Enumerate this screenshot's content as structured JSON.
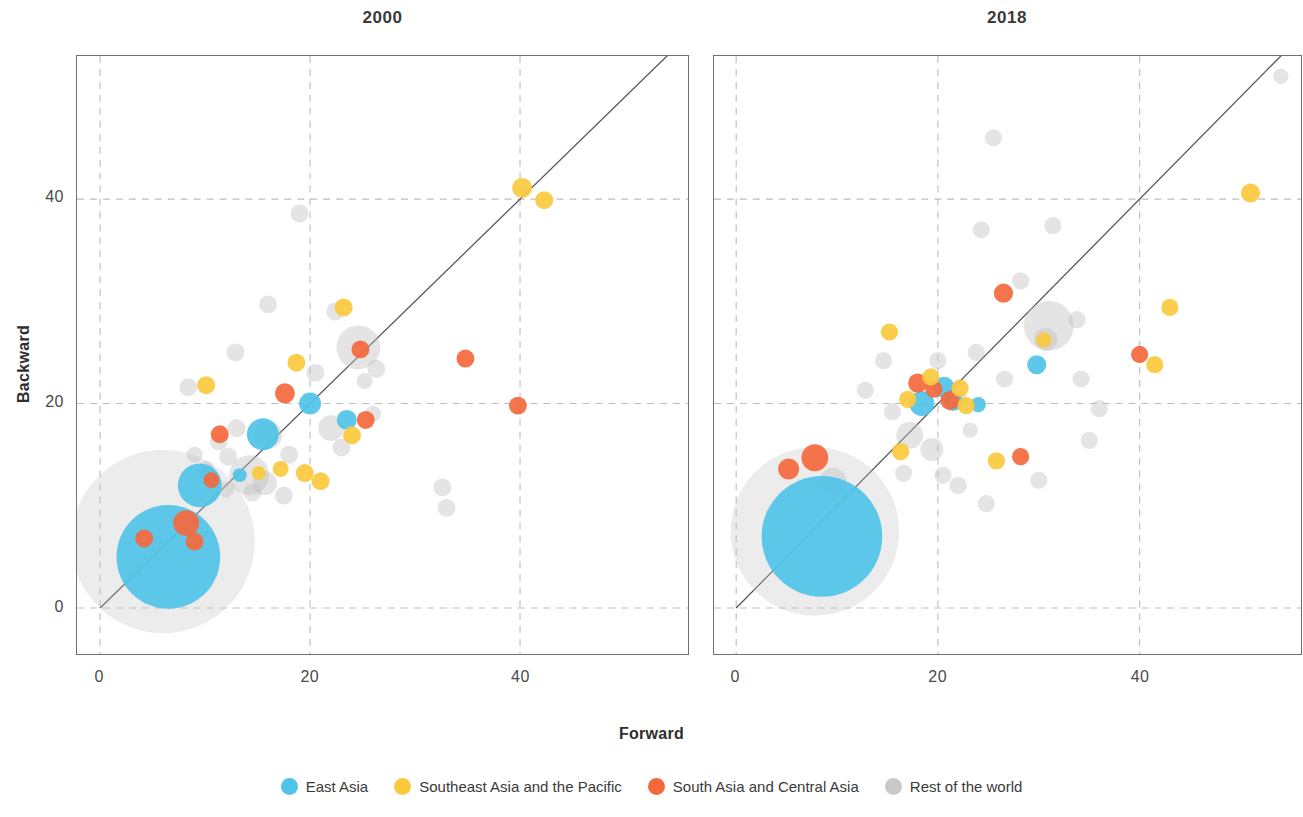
{
  "figure": {
    "xlabel": "Forward",
    "ylabel": "Backward"
  },
  "panels": [
    {
      "id": "2000",
      "title": "2000"
    },
    {
      "id": "2018",
      "title": "2018"
    }
  ],
  "axes": {
    "xticks": [
      "0",
      "20",
      "40"
    ],
    "yticks": [
      "0",
      "20",
      "40"
    ],
    "xtick_values": [
      0,
      20,
      40
    ],
    "ytick_values": [
      0,
      20,
      40
    ]
  },
  "legend": {
    "items": [
      {
        "label": "East Asia",
        "color": "#4FC3E8"
      },
      {
        "label": "Southeast Asia and the Pacific",
        "color": "#FBC93D"
      },
      {
        "label": "South Asia and Central Asia",
        "color": "#F4683C"
      },
      {
        "label": "Rest of the world",
        "color": "#BFBFBF"
      }
    ]
  },
  "colors": {
    "east_asia": "#4FC3E8",
    "southeast_asia": "#FBC93D",
    "south_central_asia": "#F4683C",
    "rest_of_world": "#BFBFBF",
    "gridline": "#BDBDBD",
    "frame": "#6F6F6F",
    "diagonal": "#55555a",
    "text": "#3a3a3a"
  },
  "chart_data": {
    "type": "scatter",
    "xlabel": "Forward",
    "ylabel": "Backward",
    "grid": true,
    "legend_position": "bottom",
    "note": "Bubble area encodes economy size; a 45-degree identity line is drawn from the origin to the top-right corner of each panel.",
    "series_names": [
      "East Asia",
      "Southeast Asia and the Pacific",
      "South Asia and Central Asia",
      "Rest of the world"
    ],
    "panels": [
      {
        "name": "2000",
        "xlim": [
          -2.2,
          56
        ],
        "ylim": [
          -4.5,
          54
        ],
        "identity_line": {
          "from": [
            0,
            0
          ],
          "to": [
            56,
            56
          ]
        },
        "points": [
          {
            "group": "East Asia",
            "x": 6.5,
            "y": 5.0,
            "r": 52
          },
          {
            "group": "East Asia",
            "x": 9.5,
            "y": 12.0,
            "r": 22
          },
          {
            "group": "East Asia",
            "x": 15.5,
            "y": 17.0,
            "r": 16
          },
          {
            "group": "East Asia",
            "x": 20.0,
            "y": 20.0,
            "r": 11
          },
          {
            "group": "East Asia",
            "x": 23.5,
            "y": 18.4,
            "r": 10
          },
          {
            "group": "East Asia",
            "x": 13.3,
            "y": 13.0,
            "r": 7
          },
          {
            "group": "South Asia and Central Asia",
            "x": 8.2,
            "y": 8.3,
            "r": 13
          },
          {
            "group": "South Asia and Central Asia",
            "x": 4.2,
            "y": 6.8,
            "r": 9
          },
          {
            "group": "South Asia and Central Asia",
            "x": 9.0,
            "y": 6.5,
            "r": 9
          },
          {
            "group": "South Asia and Central Asia",
            "x": 10.6,
            "y": 12.5,
            "r": 8
          },
          {
            "group": "South Asia and Central Asia",
            "x": 11.4,
            "y": 17.0,
            "r": 9
          },
          {
            "group": "South Asia and Central Asia",
            "x": 17.6,
            "y": 21.0,
            "r": 10
          },
          {
            "group": "South Asia and Central Asia",
            "x": 24.8,
            "y": 25.3,
            "r": 9
          },
          {
            "group": "South Asia and Central Asia",
            "x": 25.3,
            "y": 18.4,
            "r": 9
          },
          {
            "group": "South Asia and Central Asia",
            "x": 34.8,
            "y": 24.4,
            "r": 9
          },
          {
            "group": "South Asia and Central Asia",
            "x": 39.8,
            "y": 19.8,
            "r": 9
          },
          {
            "group": "Southeast Asia and the Pacific",
            "x": 40.2,
            "y": 41.1,
            "r": 10
          },
          {
            "group": "Southeast Asia and the Pacific",
            "x": 42.3,
            "y": 39.9,
            "r": 9
          },
          {
            "group": "Southeast Asia and the Pacific",
            "x": 23.2,
            "y": 29.4,
            "r": 9
          },
          {
            "group": "Southeast Asia and the Pacific",
            "x": 18.7,
            "y": 24.0,
            "r": 9
          },
          {
            "group": "Southeast Asia and the Pacific",
            "x": 10.1,
            "y": 21.8,
            "r": 9
          },
          {
            "group": "Southeast Asia and the Pacific",
            "x": 17.2,
            "y": 13.6,
            "r": 8
          },
          {
            "group": "Southeast Asia and the Pacific",
            "x": 19.5,
            "y": 13.2,
            "r": 9
          },
          {
            "group": "Southeast Asia and the Pacific",
            "x": 21.0,
            "y": 12.4,
            "r": 9
          },
          {
            "group": "Southeast Asia and the Pacific",
            "x": 24.0,
            "y": 16.9,
            "r": 9
          },
          {
            "group": "Southeast Asia and the Pacific",
            "x": 15.1,
            "y": 13.2,
            "r": 7
          },
          {
            "group": "Rest of the world",
            "x": 6.0,
            "y": 6.5,
            "r": 92
          },
          {
            "group": "Rest of the world",
            "x": 24.6,
            "y": 25.5,
            "r": 22
          },
          {
            "group": "Rest of the world",
            "x": 14.2,
            "y": 13.0,
            "r": 20
          },
          {
            "group": "Rest of the world",
            "x": 16.0,
            "y": 16.9,
            "r": 14
          },
          {
            "group": "Rest of the world",
            "x": 15.7,
            "y": 12.2,
            "r": 12
          },
          {
            "group": "Rest of the world",
            "x": 22.0,
            "y": 17.6,
            "r": 13
          },
          {
            "group": "Rest of the world",
            "x": 19.0,
            "y": 38.6,
            "r": 9
          },
          {
            "group": "Rest of the world",
            "x": 16.0,
            "y": 29.7,
            "r": 9
          },
          {
            "group": "Rest of the world",
            "x": 22.4,
            "y": 29.0,
            "r": 9
          },
          {
            "group": "Rest of the world",
            "x": 12.9,
            "y": 25.0,
            "r": 9
          },
          {
            "group": "Rest of the world",
            "x": 8.4,
            "y": 21.6,
            "r": 9
          },
          {
            "group": "Rest of the world",
            "x": 20.5,
            "y": 23.0,
            "r": 9
          },
          {
            "group": "Rest of the world",
            "x": 26.3,
            "y": 23.4,
            "r": 9
          },
          {
            "group": "Rest of the world",
            "x": 13.0,
            "y": 17.6,
            "r": 9
          },
          {
            "group": "Rest of the world",
            "x": 11.3,
            "y": 16.3,
            "r": 9
          },
          {
            "group": "Rest of the world",
            "x": 12.2,
            "y": 14.8,
            "r": 9
          },
          {
            "group": "Rest of the world",
            "x": 18.0,
            "y": 15.0,
            "r": 9
          },
          {
            "group": "Rest of the world",
            "x": 23.0,
            "y": 15.7,
            "r": 9
          },
          {
            "group": "Rest of the world",
            "x": 9.0,
            "y": 15.0,
            "r": 8
          },
          {
            "group": "Rest of the world",
            "x": 10.1,
            "y": 13.6,
            "r": 8
          },
          {
            "group": "Rest of the world",
            "x": 14.5,
            "y": 11.3,
            "r": 9
          },
          {
            "group": "Rest of the world",
            "x": 17.5,
            "y": 11.0,
            "r": 9
          },
          {
            "group": "Rest of the world",
            "x": 12.0,
            "y": 11.6,
            "r": 8
          },
          {
            "group": "Rest of the world",
            "x": 32.6,
            "y": 11.8,
            "r": 9
          },
          {
            "group": "Rest of the world",
            "x": 33.0,
            "y": 9.8,
            "r": 9
          },
          {
            "group": "Rest of the world",
            "x": 25.2,
            "y": 22.2,
            "r": 8
          },
          {
            "group": "Rest of the world",
            "x": 26.0,
            "y": 19.0,
            "r": 8
          }
        ]
      },
      {
        "name": "2018",
        "xlim": [
          -2.2,
          56
        ],
        "ylim": [
          -4.5,
          54
        ],
        "identity_line": {
          "from": [
            0,
            0
          ],
          "to": [
            56,
            56
          ]
        },
        "points": [
          {
            "group": "East Asia",
            "x": 8.5,
            "y": 7.0,
            "r": 63
          },
          {
            "group": "East Asia",
            "x": 18.4,
            "y": 20.0,
            "r": 13
          },
          {
            "group": "East Asia",
            "x": 20.6,
            "y": 21.6,
            "r": 11
          },
          {
            "group": "East Asia",
            "x": 21.5,
            "y": 20.2,
            "r": 10
          },
          {
            "group": "East Asia",
            "x": 29.8,
            "y": 23.8,
            "r": 10
          },
          {
            "group": "East Asia",
            "x": 24.0,
            "y": 19.9,
            "r": 8
          },
          {
            "group": "South Asia and Central Asia",
            "x": 7.8,
            "y": 14.7,
            "r": 14
          },
          {
            "group": "South Asia and Central Asia",
            "x": 5.2,
            "y": 13.6,
            "r": 11
          },
          {
            "group": "South Asia and Central Asia",
            "x": 18.0,
            "y": 22.0,
            "r": 10
          },
          {
            "group": "South Asia and Central Asia",
            "x": 19.6,
            "y": 21.4,
            "r": 9
          },
          {
            "group": "South Asia and Central Asia",
            "x": 21.2,
            "y": 20.3,
            "r": 10
          },
          {
            "group": "South Asia and Central Asia",
            "x": 26.5,
            "y": 30.8,
            "r": 10
          },
          {
            "group": "South Asia and Central Asia",
            "x": 28.2,
            "y": 14.8,
            "r": 9
          },
          {
            "group": "South Asia and Central Asia",
            "x": 40.0,
            "y": 24.8,
            "r": 9
          },
          {
            "group": "Southeast Asia and the Pacific",
            "x": 51.0,
            "y": 40.6,
            "r": 10
          },
          {
            "group": "Southeast Asia and the Pacific",
            "x": 43.0,
            "y": 29.4,
            "r": 9
          },
          {
            "group": "Southeast Asia and the Pacific",
            "x": 41.5,
            "y": 23.8,
            "r": 9
          },
          {
            "group": "Southeast Asia and the Pacific",
            "x": 15.2,
            "y": 27.0,
            "r": 9
          },
          {
            "group": "Southeast Asia and the Pacific",
            "x": 17.0,
            "y": 20.4,
            "r": 9
          },
          {
            "group": "Southeast Asia and the Pacific",
            "x": 19.3,
            "y": 22.6,
            "r": 9
          },
          {
            "group": "Southeast Asia and the Pacific",
            "x": 22.2,
            "y": 21.5,
            "r": 9
          },
          {
            "group": "Southeast Asia and the Pacific",
            "x": 22.8,
            "y": 19.8,
            "r": 9
          },
          {
            "group": "Southeast Asia and the Pacific",
            "x": 25.8,
            "y": 14.4,
            "r": 9
          },
          {
            "group": "Southeast Asia and the Pacific",
            "x": 16.3,
            "y": 15.3,
            "r": 9
          },
          {
            "group": "Southeast Asia and the Pacific",
            "x": 30.5,
            "y": 26.2,
            "r": 8
          },
          {
            "group": "Rest of the world",
            "x": 7.8,
            "y": 7.5,
            "r": 88
          },
          {
            "group": "Rest of the world",
            "x": 31.0,
            "y": 27.6,
            "r": 26
          },
          {
            "group": "Rest of the world",
            "x": 9.6,
            "y": 12.4,
            "r": 14
          },
          {
            "group": "Rest of the world",
            "x": 17.2,
            "y": 16.9,
            "r": 14
          },
          {
            "group": "Rest of the world",
            "x": 19.4,
            "y": 15.5,
            "r": 12
          },
          {
            "group": "Rest of the world",
            "x": 21.8,
            "y": 20.5,
            "r": 11
          },
          {
            "group": "Rest of the world",
            "x": 30.7,
            "y": 26.3,
            "r": 12
          },
          {
            "group": "Rest of the world",
            "x": 25.5,
            "y": 46.0,
            "r": 9
          },
          {
            "group": "Rest of the world",
            "x": 24.3,
            "y": 37.0,
            "r": 9
          },
          {
            "group": "Rest of the world",
            "x": 28.2,
            "y": 32.0,
            "r": 9
          },
          {
            "group": "Rest of the world",
            "x": 31.4,
            "y": 37.4,
            "r": 9
          },
          {
            "group": "Rest of the world",
            "x": 14.6,
            "y": 24.2,
            "r": 9
          },
          {
            "group": "Rest of the world",
            "x": 12.8,
            "y": 21.3,
            "r": 9
          },
          {
            "group": "Rest of the world",
            "x": 20.0,
            "y": 24.2,
            "r": 9
          },
          {
            "group": "Rest of the world",
            "x": 23.8,
            "y": 25.0,
            "r": 9
          },
          {
            "group": "Rest of the world",
            "x": 26.6,
            "y": 22.4,
            "r": 9
          },
          {
            "group": "Rest of the world",
            "x": 33.8,
            "y": 28.2,
            "r": 9
          },
          {
            "group": "Rest of the world",
            "x": 34.2,
            "y": 22.4,
            "r": 9
          },
          {
            "group": "Rest of the world",
            "x": 36.0,
            "y": 19.5,
            "r": 9
          },
          {
            "group": "Rest of the world",
            "x": 15.5,
            "y": 19.2,
            "r": 9
          },
          {
            "group": "Rest of the world",
            "x": 16.6,
            "y": 13.2,
            "r": 9
          },
          {
            "group": "Rest of the world",
            "x": 20.5,
            "y": 13.0,
            "r": 9
          },
          {
            "group": "Rest of the world",
            "x": 22.0,
            "y": 12.0,
            "r": 9
          },
          {
            "group": "Rest of the world",
            "x": 24.8,
            "y": 10.2,
            "r": 9
          },
          {
            "group": "Rest of the world",
            "x": 35.0,
            "y": 16.4,
            "r": 9
          },
          {
            "group": "Rest of the world",
            "x": 30.0,
            "y": 12.5,
            "r": 9
          },
          {
            "group": "Rest of the world",
            "x": 54.0,
            "y": 52.0,
            "r": 8
          },
          {
            "group": "Rest of the world",
            "x": 23.2,
            "y": 17.4,
            "r": 8
          }
        ]
      }
    ]
  }
}
